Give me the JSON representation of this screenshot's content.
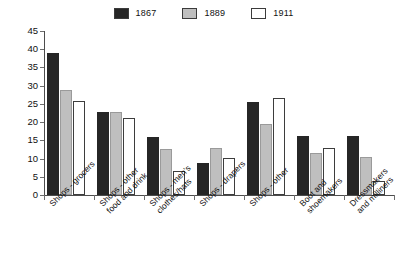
{
  "chart_data": {
    "type": "bar",
    "title": "",
    "subtitle": "",
    "xlabel": "",
    "ylabel": "",
    "ylim": [
      0,
      45
    ],
    "y_ticks": [
      0,
      5,
      10,
      15,
      20,
      25,
      30,
      35,
      40,
      45
    ],
    "grid": false,
    "legend_position": "top-center",
    "categories": [
      "Shops - grocers",
      "Shops - other\nfood and drink",
      "Shops - men's\nclothes/hats",
      "Shops - drapers",
      "Shops - other",
      "Boot and\nshoemakers",
      "Dressmakers\nand milliners"
    ],
    "series": [
      {
        "name": "1867",
        "color": "#262626",
        "values": [
          38.9,
          22.8,
          15.9,
          8.9,
          25.5,
          16.2,
          16.3
        ]
      },
      {
        "name": "1889",
        "color": "#bfbfbf",
        "values": [
          28.9,
          22.8,
          12.7,
          12.9,
          19.4,
          11.4,
          10.4
        ]
      },
      {
        "name": "1911",
        "color": "#ffffff",
        "values": [
          25.9,
          21.1,
          6.6,
          10.2,
          26.7,
          12.8,
          3.8
        ]
      }
    ]
  },
  "legend": {
    "entries": [
      {
        "label": "1867",
        "swatch": "dark-square-swatch"
      },
      {
        "label": "1889",
        "swatch": "gray-square-swatch"
      },
      {
        "label": "1911",
        "swatch": "white-square-swatch"
      }
    ]
  },
  "axis": {
    "y_tick_labels": [
      "45",
      "40",
      "35",
      "30",
      "25",
      "20",
      "15",
      "10",
      "5",
      "0"
    ]
  },
  "colors": {
    "series_1867": "#262626",
    "series_1889": "#bfbfbf",
    "series_1911": "#ffffff",
    "axis": "#4d4d4d",
    "text": "#111111",
    "background": "#ffffff"
  }
}
